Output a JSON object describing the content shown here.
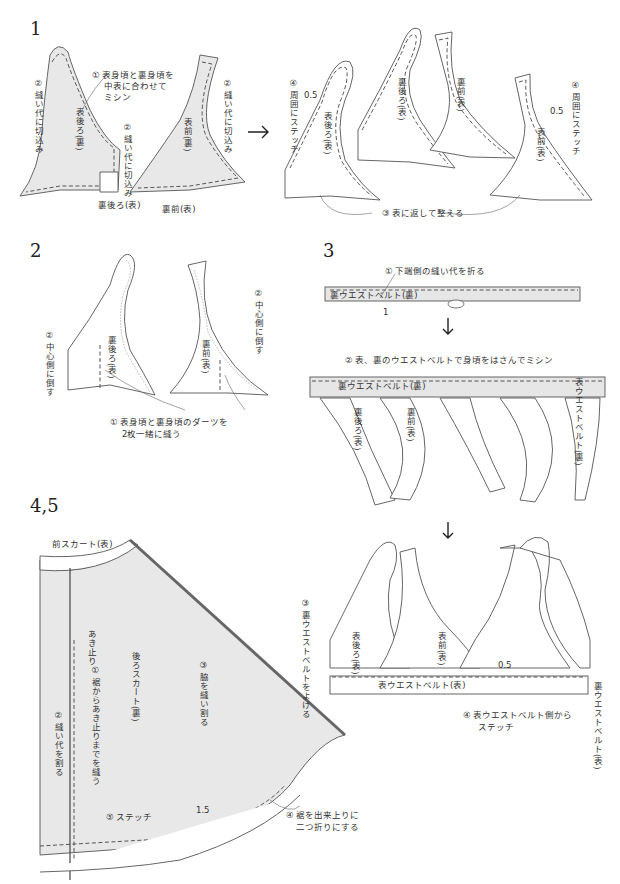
{
  "colors": {
    "shade": "#e8e8e8",
    "line": "#555555",
    "text": "#333333",
    "background": "#ffffff"
  },
  "steps": [
    {
      "number": "1",
      "pieces": [
        "表後ろ(裏)",
        "表前(裏)",
        "裏後ろ(表)",
        "裏前(表)"
      ],
      "notes": {
        "n1": "① 表身頃と裏身頃を",
        "n1b": "中表に合わせて",
        "n1c": "ミシン",
        "n2_left": "② 縫い代に切込み",
        "n2_mid": "② 縫い代に切込み",
        "n2_right": "② 縫い代に切込み",
        "label_back_lining": "裏後ろ(表)",
        "label_front_lining": "裏前(表)"
      },
      "after": {
        "pieces": [
          "表後ろ(表)",
          "裏後ろ(表)",
          "裏前(表)",
          "表前(表)"
        ],
        "n3": "③ 表に返して整える",
        "n4_left": "④ 周囲にステッチ",
        "n4_right": "④ 周囲にステッチ",
        "seam_left": "0.5",
        "seam_right": "0.5"
      },
      "arrow": "→"
    },
    {
      "number": "2",
      "pieces": [
        "裏後ろ(表)",
        "裏前(表)"
      ],
      "notes": {
        "n1": "① 表身頃と裏身頃のダーツを",
        "n1b": "2枚一緒に縫う",
        "n2_left": "② 中心側に倒す",
        "n2_right": "② 中心側に倒す"
      }
    },
    {
      "number": "3",
      "notes": {
        "n1": "① 下端側の縫い代を折る",
        "belt_label": "裏ウエストベルト(裏)",
        "seam": "1",
        "n2": "② 表、裏のウエストベルトで身頃をはさんでミシン",
        "belt_label2": "裏ウエストベルト(裏)",
        "outer_belt": "表ウエストベルト(裏)",
        "pieces": [
          "裏後ろ(表)",
          "裏前(表)"
        ]
      },
      "arrow_down": "↓"
    },
    {
      "number": "4,5",
      "notes": {
        "front_skirt": "前スカート(表)",
        "back_skirt": "後ろスカート(裏)",
        "opening_end": "あき止り",
        "n1": "① 裾からあき止りまでを縫う",
        "n2": "② 縫い代を割る",
        "n3": "③ 脇を縫い割る",
        "n4": "④ 裾を出来上りに",
        "n4b": "二つ折りにする",
        "n5": "⑤ ステッチ",
        "hem": "1.5"
      }
    },
    {
      "number": "",
      "notes": {
        "n3": "③ 裏ウエストベルトをよける",
        "pieces": [
          "表後ろ(表)",
          "表前(表)"
        ],
        "belt": "表ウエストベルト(表)",
        "seam": "0.5",
        "n4": "④ 表ウエストベルト側から",
        "n4b": "ステッチ",
        "inner_belt": "裏ウエストベルト(表)"
      },
      "arrow_down": "↓"
    }
  ]
}
